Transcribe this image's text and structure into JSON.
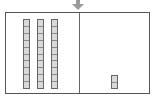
{
  "diagram": {
    "type": "place-value-blocks",
    "indicator": {
      "icon": "down-arrow-icon",
      "color": "#9a9a9a"
    },
    "columns": [
      {
        "name": "tens",
        "rods": 3,
        "cells_per_rod": 10
      },
      {
        "name": "ones",
        "rods": 1,
        "cells_per_rod": 2
      }
    ],
    "colors": {
      "frame": "#555555",
      "block_fill": "#d9d9d9",
      "block_border": "#666666"
    }
  }
}
